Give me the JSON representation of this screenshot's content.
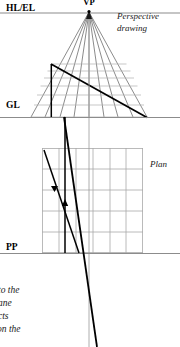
{
  "figure": {
    "labels": {
      "vp": "VP",
      "hl_el": "HL/EL",
      "gl": "GL",
      "pp": "PP",
      "perspective_line1": "Perspective",
      "perspective_line2": "drawing",
      "plan": "Plan"
    },
    "caption": {
      "line1": "to the",
      "line2": "ane",
      "line3": "cts",
      "line4": "on the"
    },
    "colors": {
      "reference_line": "#8c8c8c",
      "grid_line": "#a8a8a8",
      "construction_line": "#3d3d3d",
      "bold_line": "#000000",
      "text": "#000000"
    },
    "geometry": {
      "vp": {
        "x": 89,
        "y": 11
      },
      "hl_el_line_y": 13,
      "gl_line_y": 117,
      "pp_line_y": 253,
      "vertical_axis_x": 89,
      "plan_grid": {
        "left": 42,
        "right": 143,
        "top": 148,
        "bottom": 253,
        "columns": 6,
        "rows": 5
      },
      "perspective_grid": {
        "left_base": 31,
        "right_base": 147,
        "top_y": 63,
        "bottom_y": 117,
        "rays": 9,
        "horizontals": 7
      },
      "bold_diagonal_perspective": {
        "x1": 51,
        "y1": 64,
        "x2": 147,
        "y2": 117
      },
      "bold_vertical_left": {
        "x": 51,
        "y1": 64,
        "y2": 117
      },
      "bold_projector": {
        "x1": 64,
        "y1": 117,
        "x2": 96,
        "y2": 347
      },
      "plan_diagonal": {
        "x1": 44,
        "y1": 150,
        "x2": 78,
        "y2": 253
      },
      "plan_vertical": {
        "x": 65,
        "y1": 117,
        "y2": 253
      }
    }
  }
}
